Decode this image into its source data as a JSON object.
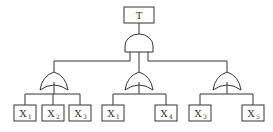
{
  "diagram": {
    "type": "fault-tree",
    "top_event": {
      "label": "T"
    },
    "top_gate": {
      "type": "AND"
    },
    "sub_gates": [
      {
        "type": "OR",
        "inputs": [
          {
            "base": "X",
            "sub": "1"
          },
          {
            "base": "X",
            "sub": "2"
          },
          {
            "base": "X",
            "sub": "3"
          }
        ]
      },
      {
        "type": "OR",
        "inputs": [
          {
            "base": "X",
            "sub": "1"
          },
          {
            "base": "X",
            "sub": "4"
          }
        ]
      },
      {
        "type": "OR",
        "inputs": [
          {
            "base": "X",
            "sub": "3"
          },
          {
            "base": "X",
            "sub": "5"
          }
        ]
      }
    ]
  }
}
